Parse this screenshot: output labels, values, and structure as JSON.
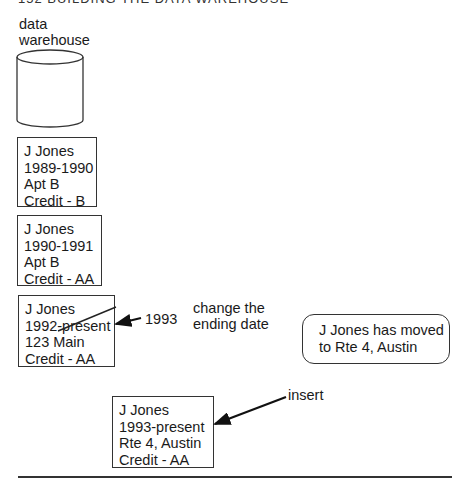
{
  "header": {
    "text": "152    BUILDING THE DATA WAREHOUSE"
  },
  "warehouse": {
    "label": "data\nwarehouse",
    "icon": "database-cylinder-icon"
  },
  "records": [
    {
      "name": "J Jones",
      "period": "1989-1990",
      "address": "Apt B",
      "credit": "Credit - B"
    },
    {
      "name": "J Jones",
      "period": "1990-1991",
      "address": "Apt B",
      "credit": "Credit - AA"
    },
    {
      "name": "J Jones",
      "period": "1992-present",
      "address": "123 Main",
      "credit": "Credit - AA"
    },
    {
      "name": "J Jones",
      "period": "1993-present",
      "address": "Rte 4, Austin",
      "credit": "Credit - AA"
    }
  ],
  "annotations": {
    "update_value": "1993",
    "update_note": "change the\nending date",
    "event_note": "J Jones has moved\nto Rte 4, Austin",
    "insert_label": "insert"
  }
}
